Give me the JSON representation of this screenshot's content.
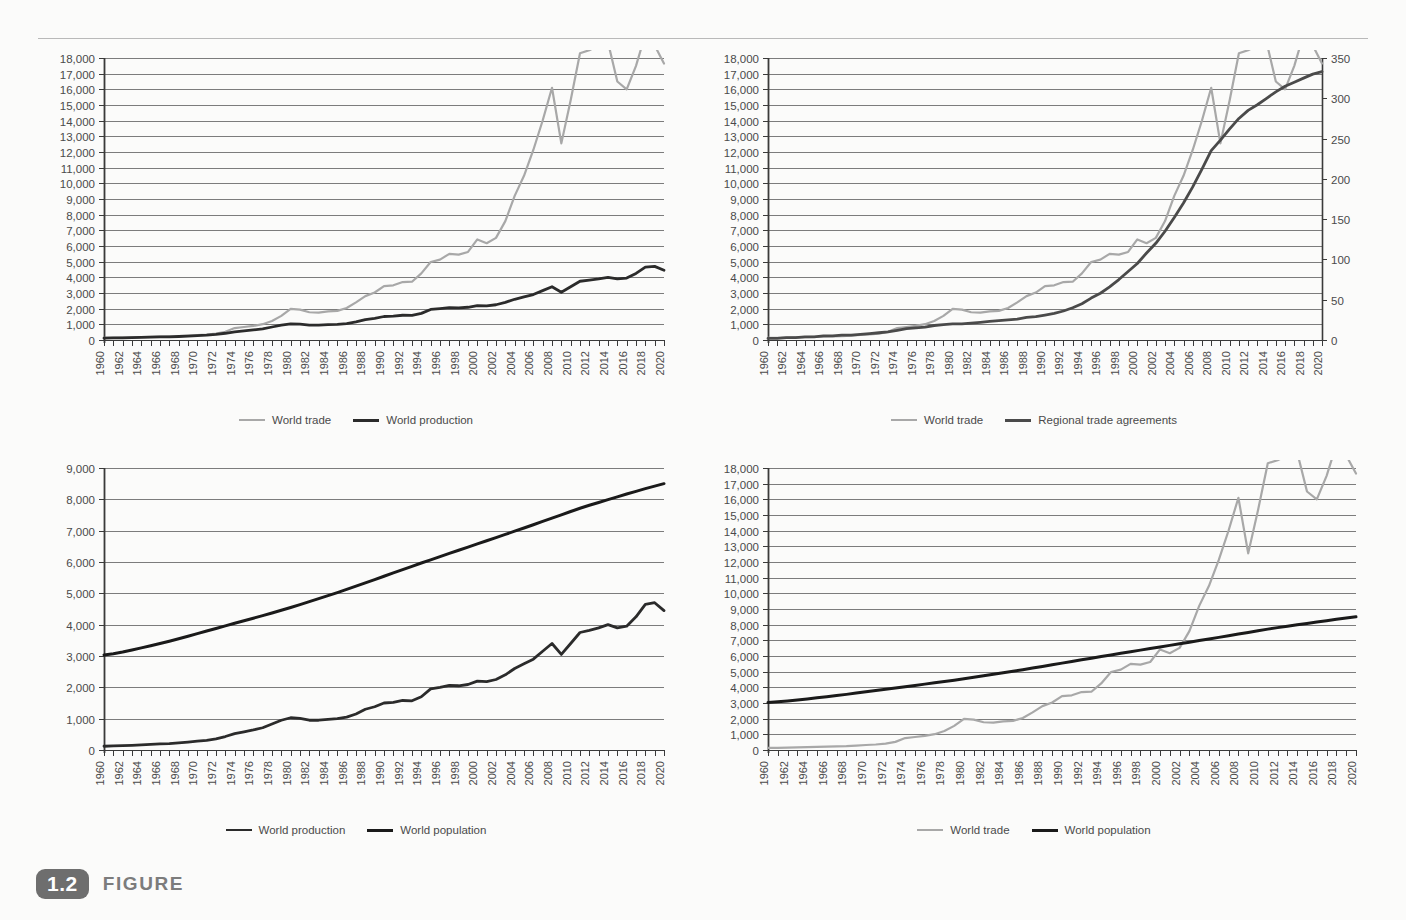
{
  "figure": {
    "number": "1.2",
    "label": "FIGURE"
  },
  "colors": {
    "world_trade": "#a8a8a8",
    "world_production": "#2b2b2b",
    "world_population": "#1a1a1a",
    "regional_trade_agreements": "#4a4a4a",
    "gridline": "#6d6d6d",
    "axis": "#3a3a3a",
    "text": "#4a4a4a",
    "background": "#fbfbfa",
    "badge": "#6e6e6e",
    "caption_text": "#7c7c7c"
  },
  "x_axis": {
    "label_years": [
      1960,
      1962,
      1964,
      1966,
      1968,
      1970,
      1972,
      1974,
      1976,
      1978,
      1980,
      1982,
      1984,
      1986,
      1988,
      1990,
      1992,
      1994,
      1996,
      1998,
      2000,
      2002,
      2004,
      2006,
      2008,
      2010,
      2012,
      2014,
      2016,
      2018,
      2020
    ],
    "min": 1960,
    "max": 2020,
    "tick_step": 1,
    "label_step": 2
  },
  "series_years": [
    1960,
    1961,
    1962,
    1963,
    1964,
    1965,
    1966,
    1967,
    1968,
    1969,
    1970,
    1971,
    1972,
    1973,
    1974,
    1975,
    1976,
    1977,
    1978,
    1979,
    1980,
    1981,
    1982,
    1983,
    1984,
    1985,
    1986,
    1987,
    1988,
    1989,
    1990,
    1991,
    1992,
    1993,
    1994,
    1995,
    1996,
    1997,
    1998,
    1999,
    2000,
    2001,
    2002,
    2003,
    2004,
    2005,
    2006,
    2007,
    2008,
    2009,
    2010,
    2011,
    2012,
    2013,
    2014,
    2015,
    2016,
    2017,
    2018,
    2019,
    2020
  ],
  "series": {
    "world_trade": {
      "name": "World trade",
      "unit": "US$ billions",
      "values": [
        130,
        140,
        150,
        165,
        185,
        200,
        220,
        230,
        250,
        285,
        320,
        350,
        410,
        520,
        760,
        830,
        900,
        1010,
        1210,
        1540,
        1990,
        1940,
        1770,
        1750,
        1830,
        1860,
        2040,
        2400,
        2800,
        3030,
        3440,
        3490,
        3700,
        3720,
        4250,
        4980,
        5130,
        5500,
        5450,
        5620,
        6420,
        6180,
        6520,
        7590,
        9200,
        10480,
        12130,
        14010,
        16100,
        12550,
        15300,
        18300,
        18500,
        18800,
        19000,
        16500,
        16000,
        17500,
        19500,
        18800,
        17650
      ],
      "display_scale_note": "plotted values rescaled to chart max 16,600 at 2020"
    },
    "world_production": {
      "name": "World production",
      "unit": "US$ billions",
      "values": [
        120,
        130,
        140,
        150,
        165,
        180,
        195,
        205,
        225,
        250,
        280,
        310,
        355,
        430,
        520,
        580,
        640,
        710,
        830,
        950,
        1030,
        1010,
        950,
        950,
        980,
        1000,
        1050,
        1150,
        1300,
        1380,
        1500,
        1520,
        1580,
        1570,
        1700,
        1950,
        2000,
        2060,
        2050,
        2090,
        2200,
        2180,
        2250,
        2400,
        2600,
        2750,
        2900,
        3150,
        3400,
        3050,
        3400,
        3750,
        3820,
        3900,
        4000,
        3900,
        3950,
        4250,
        4650,
        4700,
        4450
      ],
      "display_scale_note": "plotted against left axis 0-18,000"
    },
    "world_population": {
      "name": "World population",
      "unit": "millions",
      "values": [
        3035,
        3075,
        3128,
        3193,
        3260,
        3329,
        3400,
        3473,
        3551,
        3632,
        3714,
        3797,
        3879,
        3961,
        4043,
        4124,
        4205,
        4287,
        4372,
        4459,
        4548,
        4640,
        4734,
        4829,
        4926,
        5025,
        5126,
        5229,
        5333,
        5439,
        5545,
        5652,
        5758,
        5863,
        5967,
        6070,
        6172,
        6274,
        6375,
        6476,
        6577,
        6678,
        6780,
        6881,
        6983,
        7086,
        7190,
        7294,
        7400,
        7506,
        7612,
        7715,
        7810,
        7900,
        7990,
        8080,
        8170,
        8255,
        8340,
        8420,
        8500
      ],
      "display_scale_note": "rendered as near-linear line from ~3,000 to ~7,700"
    },
    "regional_trade_agreements": {
      "name": "Regional trade agreements",
      "unit": "cumulative count",
      "values": [
        2,
        2,
        3,
        3,
        4,
        4,
        5,
        5,
        6,
        6,
        7,
        8,
        9,
        10,
        12,
        14,
        15,
        16,
        18,
        19,
        20,
        20,
        21,
        22,
        23,
        24,
        25,
        26,
        28,
        29,
        31,
        33,
        36,
        40,
        45,
        52,
        58,
        66,
        75,
        85,
        95,
        108,
        120,
        135,
        152,
        170,
        190,
        212,
        235,
        248,
        262,
        275,
        285,
        292,
        300,
        308,
        315,
        320,
        325,
        330,
        333
      ]
    }
  },
  "charts": [
    {
      "id": "top-left",
      "y_axis_left": {
        "min": 0,
        "max": 18000,
        "step": 1000,
        "ticks": [
          "0",
          "1,000",
          "2,000",
          "3,000",
          "4,000",
          "5,000",
          "6,000",
          "7,000",
          "8,000",
          "9,000",
          "10,000",
          "11,000",
          "12,000",
          "13,000",
          "14,000",
          "15,000",
          "16,000",
          "17,000",
          "18,000"
        ]
      },
      "y_axis_right": null,
      "plot_series": [
        {
          "key": "world_trade",
          "axis": "left"
        },
        {
          "key": "world_production",
          "axis": "left"
        }
      ],
      "legend": [
        {
          "label": "World trade",
          "color_key": "world_trade",
          "weight": 2.2
        },
        {
          "label": "World production",
          "color_key": "world_production",
          "weight": 3.2
        }
      ]
    },
    {
      "id": "top-right",
      "y_axis_left": {
        "min": 0,
        "max": 18000,
        "step": 1000,
        "ticks": [
          "0",
          "1,000",
          "2,000",
          "3,000",
          "4,000",
          "5,000",
          "6,000",
          "7,000",
          "8,000",
          "9,000",
          "10,000",
          "11,000",
          "12,000",
          "13,000",
          "14,000",
          "15,000",
          "16,000",
          "17,000",
          "18,000"
        ]
      },
      "y_axis_right": {
        "min": 0,
        "max": 350,
        "step": 50,
        "ticks": [
          "0",
          "50",
          "100",
          "150",
          "200",
          "250",
          "300",
          "350"
        ]
      },
      "plot_series": [
        {
          "key": "world_trade",
          "axis": "left"
        },
        {
          "key": "regional_trade_agreements",
          "axis": "right"
        }
      ],
      "legend": [
        {
          "label": "World trade",
          "color_key": "world_trade",
          "weight": 2.2
        },
        {
          "label": "Regional trade agreements",
          "color_key": "regional_trade_agreements",
          "weight": 3.2
        }
      ]
    },
    {
      "id": "bottom-left",
      "y_axis_left": {
        "min": 0,
        "max": 9000,
        "step": 1000,
        "ticks": [
          "0",
          "1,000",
          "2,000",
          "3,000",
          "4,000",
          "5,000",
          "6,000",
          "7,000",
          "8,000",
          "9,000"
        ]
      },
      "y_axis_right": null,
      "plot_series": [
        {
          "key": "world_production",
          "axis": "left"
        },
        {
          "key": "world_population",
          "axis": "left"
        }
      ],
      "legend": [
        {
          "label": "World production",
          "color_key": "world_production",
          "weight": 2.6
        },
        {
          "label": "World population",
          "color_key": "world_population",
          "weight": 3.2
        }
      ]
    },
    {
      "id": "bottom-right",
      "y_axis_left": {
        "min": 0,
        "max": 18000,
        "step": 1000,
        "ticks": [
          "0",
          "1,000",
          "2,000",
          "3,000",
          "4,000",
          "5,000",
          "6,000",
          "7,000",
          "8,000",
          "9,000",
          "10,000",
          "11,000",
          "12,000",
          "13,000",
          "14,000",
          "15,000",
          "16,000",
          "17,000",
          "18,000"
        ]
      },
      "y_axis_right": null,
      "plot_series": [
        {
          "key": "world_trade",
          "axis": "left"
        },
        {
          "key": "world_population",
          "axis": "left"
        }
      ],
      "legend": [
        {
          "label": "World trade",
          "color_key": "world_trade",
          "weight": 2.2
        },
        {
          "label": "World population",
          "color_key": "world_population",
          "weight": 3.2
        }
      ]
    }
  ],
  "chart_data": {
    "type": "line",
    "title": "",
    "subtitle": "",
    "xlabel": "",
    "ylabel": "",
    "grid": true,
    "legend_position": "bottom",
    "panels": [
      {
        "panel": "top-left",
        "xlim": [
          1960,
          2020
        ],
        "ylim": [
          0,
          18000
        ],
        "ytick_step": 1000,
        "legend": [
          "World trade",
          "World production"
        ],
        "x": [
          1960,
          1965,
          1970,
          1975,
          1980,
          1985,
          1990,
          1995,
          2000,
          2002,
          2004,
          2006,
          2008,
          2009,
          2010,
          2012,
          2014,
          2016,
          2018,
          2020
        ],
        "series": [
          {
            "name": "World trade",
            "values": [
              120,
              190,
              300,
              780,
              1870,
              1740,
              3230,
              4680,
              6030,
              6130,
              8640,
              11390,
              15120,
              11790,
              14370,
              17380,
              17850,
              15500,
              18320,
              16580
            ]
          },
          {
            "name": "World production",
            "values": [
              110,
              170,
              260,
              545,
              970,
              940,
              1410,
              1830,
              2070,
              2110,
              2440,
              2720,
              3190,
              2860,
              3190,
              3520,
              3760,
              3660,
              4370,
              4180
            ]
          }
        ]
      },
      {
        "panel": "top-right",
        "xlim": [
          1960,
          2020
        ],
        "ylim_left": [
          0,
          18000
        ],
        "ylim_right": [
          0,
          350
        ],
        "ytick_step_left": 1000,
        "ytick_step_right": 50,
        "legend": [
          "World trade",
          "Regional trade agreements"
        ],
        "x": [
          1960,
          1965,
          1970,
          1975,
          1980,
          1985,
          1990,
          1995,
          2000,
          2002,
          2004,
          2006,
          2008,
          2009,
          2010,
          2012,
          2014,
          2016,
          2018,
          2020
        ],
        "series": [
          {
            "name": "World trade",
            "axis": "left",
            "values": [
              120,
              190,
              300,
              780,
              1870,
              1740,
              3230,
              4680,
              6030,
              6130,
              8640,
              11390,
              15120,
              11790,
              14370,
              17380,
              17850,
              15500,
              18320,
              16580
            ]
          },
          {
            "name": "Regional trade agreements",
            "axis": "right",
            "values": [
              2,
              4,
              7,
              14,
              20,
              24,
              31,
              52,
              95,
              120,
              152,
              190,
              235,
              248,
              262,
              285,
              300,
              315,
              325,
              333
            ]
          }
        ]
      },
      {
        "panel": "bottom-left",
        "xlim": [
          1960,
          2020
        ],
        "ylim": [
          0,
          9000
        ],
        "ytick_step": 1000,
        "legend": [
          "World production",
          "World population"
        ],
        "x": [
          1960,
          1965,
          1970,
          1975,
          1980,
          1985,
          1990,
          1995,
          2000,
          2002,
          2004,
          2006,
          2008,
          2009,
          2010,
          2012,
          2014,
          2016,
          2018,
          2020
        ],
        "series": [
          {
            "name": "World production",
            "values": [
              110,
              170,
              260,
              545,
              970,
              940,
              1410,
              1830,
              2070,
              2110,
              2440,
              2720,
              3190,
              2860,
              3190,
              3520,
              3760,
              3660,
              4370,
              4180
            ]
          },
          {
            "name": "World population",
            "values": [
              3035,
              3329,
              3714,
              4124,
              4548,
              5025,
              5545,
              6070,
              6577,
              6780,
              6983,
              7190,
              7400,
              7506,
              7612,
              7810,
              7990,
              8170,
              8340,
              8500
            ]
          }
        ]
      },
      {
        "panel": "bottom-right",
        "xlim": [
          1960,
          2020
        ],
        "ylim": [
          0,
          18000
        ],
        "ytick_step": 1000,
        "legend": [
          "World trade",
          "World population"
        ],
        "x": [
          1960,
          1965,
          1970,
          1975,
          1980,
          1985,
          1990,
          1995,
          2000,
          2002,
          2004,
          2006,
          2008,
          2009,
          2010,
          2012,
          2014,
          2016,
          2018,
          2020
        ],
        "series": [
          {
            "name": "World trade",
            "values": [
              120,
              190,
              300,
              780,
              1870,
              1740,
              3230,
              4680,
              6030,
              6130,
              8640,
              11390,
              15120,
              11790,
              14370,
              17380,
              17850,
              15500,
              18320,
              16580
            ]
          },
          {
            "name": "World population",
            "values": [
              3035,
              3329,
              3714,
              4124,
              4548,
              5025,
              5545,
              6070,
              6577,
              6780,
              6983,
              7190,
              7400,
              7506,
              7612,
              7810,
              7990,
              8170,
              8340,
              8500
            ]
          }
        ]
      }
    ]
  }
}
